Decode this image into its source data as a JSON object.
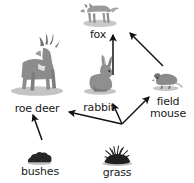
{
  "diagram": {
    "type": "food-web",
    "width": 194,
    "height": 183,
    "background": "#ffffff",
    "label_color": "#1a1a1a",
    "arrow_color": "#111111"
  },
  "nodes": [
    {
      "id": "fox",
      "label": "fox",
      "icon": "fox-icon",
      "trophic": "predator",
      "label_x": 79,
      "label_y": 29,
      "label_w": 38,
      "art_x": 76,
      "art_y": -11,
      "art_w": 48,
      "art_h": 40,
      "body_color": "#9a9a9a",
      "shadow_color": "#c9c9c9"
    },
    {
      "id": "roe-deer",
      "label": "roe deer",
      "icon": "deer-icon",
      "trophic": "herbivore",
      "label_x": 6,
      "label_y": 103,
      "label_w": 62,
      "art_x": 6,
      "art_y": 30,
      "art_w": 62,
      "art_h": 72,
      "body_color": "#8c8c8c",
      "shadow_color": "#c4c4c4"
    },
    {
      "id": "rabbit",
      "label": "rabbit",
      "icon": "rabbit-icon",
      "trophic": "herbivore",
      "label_x": 78,
      "label_y": 102,
      "label_w": 42,
      "art_x": 78,
      "art_y": 47,
      "art_w": 44,
      "art_h": 55,
      "body_color": "#8f8f8f",
      "shadow_color": "#c6c6c6"
    },
    {
      "id": "field-mouse",
      "label": "field\nmouse",
      "icon": "mouse-icon",
      "trophic": "herbivore",
      "label_x": 144,
      "label_y": 96,
      "label_w": 48,
      "art_x": 140,
      "art_y": 64,
      "art_w": 54,
      "art_h": 32,
      "body_color": "#8a8a8a",
      "shadow_color": "#c6c6c6"
    },
    {
      "id": "bushes",
      "label": "bushes",
      "icon": "bushes-icon",
      "trophic": "producer",
      "label_x": 12,
      "label_y": 166,
      "label_w": 56,
      "art_x": 12,
      "art_y": 140,
      "art_w": 56,
      "art_h": 26,
      "body_color": "#262626",
      "shadow_color": "#bdbdbd"
    },
    {
      "id": "grass",
      "label": "grass",
      "icon": "grass-icon",
      "trophic": "producer",
      "label_x": 93,
      "label_y": 167,
      "label_w": 48,
      "art_x": 90,
      "art_y": 133,
      "art_w": 56,
      "art_h": 34,
      "body_color": "#1f1f1f",
      "shadow_color": "#bdbdbd"
    }
  ],
  "arrows": [
    {
      "id": "rabbit-to-fox",
      "from": "rabbit",
      "to": "fox",
      "x1": 113,
      "y1": 75,
      "x2": 113,
      "y2": 35
    },
    {
      "id": "field-mouse-to-fox",
      "from": "field-mouse",
      "to": "fox",
      "x1": 163,
      "y1": 66,
      "x2": 130,
      "y2": 33
    },
    {
      "id": "grass-to-rabbit",
      "from": "grass",
      "to": "rabbit",
      "x1": 122,
      "y1": 124,
      "x2": 113,
      "y2": 104
    },
    {
      "id": "grass-to-field-mouse",
      "from": "grass",
      "to": "field-mouse",
      "x1": 122,
      "y1": 124,
      "x2": 149,
      "y2": 97
    },
    {
      "id": "grass-to-roe-deer",
      "from": "grass",
      "to": "roe-deer",
      "x1": 122,
      "y1": 124,
      "x2": 69,
      "y2": 112
    },
    {
      "id": "bushes-to-roe-deer",
      "from": "bushes",
      "to": "roe-deer",
      "x1": 42,
      "y1": 140,
      "x2": 33,
      "y2": 115
    }
  ],
  "chart_data": {
    "type": "diagram",
    "nodes": [
      "fox",
      "roe deer",
      "rabbit",
      "field mouse",
      "bushes",
      "grass"
    ],
    "edges": [
      {
        "source": "rabbit",
        "target": "fox"
      },
      {
        "source": "field mouse",
        "target": "fox"
      },
      {
        "source": "grass",
        "target": "rabbit"
      },
      {
        "source": "grass",
        "target": "field mouse"
      },
      {
        "source": "grass",
        "target": "roe deer"
      },
      {
        "source": "bushes",
        "target": "roe deer"
      }
    ]
  }
}
